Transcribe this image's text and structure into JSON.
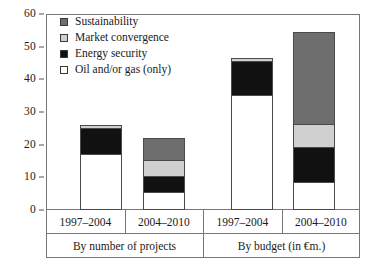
{
  "chart_data": {
    "type": "bar",
    "subtype": "stacked",
    "title": "",
    "xlabel": "",
    "ylabel": "",
    "ylim": [
      0,
      60
    ],
    "yticks": [
      0,
      10,
      20,
      30,
      40,
      50,
      60
    ],
    "grid": false,
    "legend_position": "top-left",
    "categories": [
      "1997–2004",
      "2004–2010",
      "1997–2004",
      "2004–2010"
    ],
    "groups": [
      {
        "label": "By number of projects",
        "categories": [
          "1997–2004",
          "2004–2010"
        ]
      },
      {
        "label": "By budget (in €m.)",
        "categories": [
          "1997–2004",
          "2004–2010"
        ]
      }
    ],
    "series": [
      {
        "name": "Oil and/or gas (only)",
        "color": "#ffffff",
        "values": [
          17,
          5,
          35,
          8
        ]
      },
      {
        "name": "Energy security",
        "color": "#111111",
        "values": [
          8,
          5,
          10.5,
          11
        ]
      },
      {
        "name": "Market convergence",
        "color": "#d0d0d0",
        "values": [
          1,
          5,
          1,
          7
        ]
      },
      {
        "name": "Sustainability",
        "color": "#6e6e6e",
        "values": [
          0,
          7,
          0,
          28.5
        ]
      }
    ],
    "totals": [
      26,
      22,
      46.5,
      54.5
    ]
  },
  "legend": {
    "items": [
      {
        "label": "Sustainability",
        "color": "#6e6e6e"
      },
      {
        "label": "Market convergence",
        "color": "#d0d0d0"
      },
      {
        "label": "Energy security",
        "color": "#111111"
      },
      {
        "label": "Oil and/or gas (only)",
        "color": "#ffffff"
      }
    ]
  },
  "y_axis": {
    "ticks": [
      "60",
      "50",
      "40",
      "30",
      "20",
      "10",
      "0"
    ]
  },
  "x_axis": {
    "categories": [
      "1997–2004",
      "2004–2010",
      "1997–2004",
      "2004–2010"
    ],
    "group_labels": [
      "By number of projects",
      "By budget (in €m.)"
    ]
  }
}
